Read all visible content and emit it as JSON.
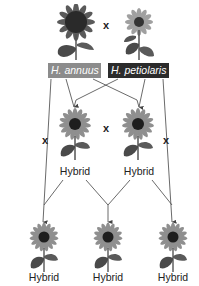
{
  "diagram": {
    "parents": [
      {
        "species": "H. annuus",
        "label_color": "#8c8c8c",
        "head_color": "#2a2a2a",
        "petal_color": "#555555"
      },
      {
        "species": "H. petiolaris",
        "label_color": "#2b2b2b",
        "head_color": "#333333",
        "petal_color": "#9a9a9a"
      }
    ],
    "cross_symbol": "x",
    "f1": [
      {
        "label": "Hybrid"
      },
      {
        "label": "Hybrid"
      }
    ],
    "backcross_symbols": [
      "x",
      "x"
    ],
    "f2": [
      {
        "label": "Hybrid"
      },
      {
        "label": "Hybrid"
      },
      {
        "label": "Hybrid"
      }
    ],
    "colors": {
      "line": "#444444",
      "hybrid_petal": "#8f8f8f",
      "hybrid_head": "#1e1e1e",
      "leaf": "#4a4a4a"
    }
  }
}
